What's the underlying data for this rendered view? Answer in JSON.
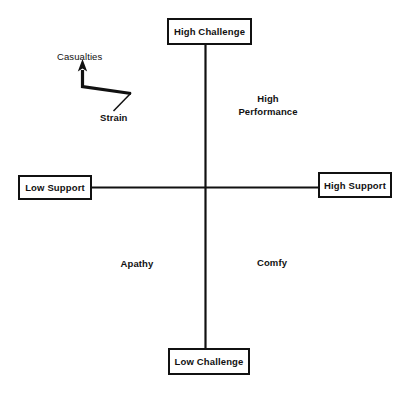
{
  "diagram": {
    "type": "two-axis-quadrant-matrix",
    "background_color": "#ffffff",
    "line_color": "#111111",
    "axes": {
      "vertical": {
        "top_label": "High Challenge",
        "bottom_label": "Low Challenge"
      },
      "horizontal": {
        "left_label": "Low Support",
        "right_label": "High Support"
      }
    },
    "boxes": {
      "high_challenge": "High Challenge",
      "low_challenge": "Low Challenge",
      "low_support": "Low Support",
      "high_support": "High Support"
    },
    "quadrant_labels": {
      "top_right": "High\nPerformance",
      "bottom_left": "Apathy",
      "bottom_right": "Comfy"
    },
    "annotation": {
      "arrow_tip_label": "Casualties",
      "arrow_tail_label": "Strain",
      "arrow_icon": "bent-up-arrow-icon"
    }
  }
}
